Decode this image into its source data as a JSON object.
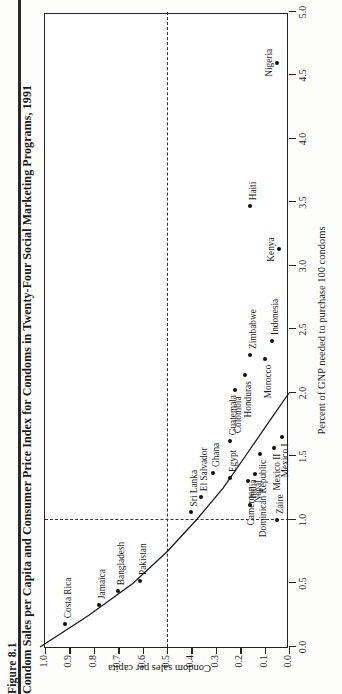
{
  "figure": {
    "number": "Figure 8.1",
    "title": "Condom Sales per Capita and Consumer Price Index for Condoms in Twenty-Four Social Marketing Programs, 1991"
  },
  "chart_data": {
    "type": "scatter",
    "title": "Condom Sales per Capita and Consumer Price Index for Condoms in Twenty-Four Social Marketing Programs, 1991",
    "xlabel": "Percent of GNP needed to purchase 100 condoms",
    "ylabel": "Condom sales per capita",
    "xlim": [
      0.0,
      5.0
    ],
    "ylim": [
      0.0,
      1.0
    ],
    "xticks": [
      "0.0",
      "0.5",
      "1.0",
      "1.5",
      "2.0",
      "2.5",
      "3.0",
      "3.5",
      "4.0",
      "4.5",
      "5.0"
    ],
    "yticks": [
      "0.0",
      "0.1",
      "0.2",
      "0.3",
      "0.4",
      "0.5",
      "0.6",
      "0.7",
      "0.8",
      "0.9",
      "1.0"
    ],
    "grid": false,
    "legend": "none",
    "reference_lines": [
      {
        "axis": "y",
        "value": 0.5,
        "style": "dashed"
      },
      {
        "axis": "x",
        "value": 1.0,
        "style": "dashed"
      }
    ],
    "points": [
      {
        "label": "Costa Rica",
        "x": 0.18,
        "y": 0.92,
        "lab_dx": 6,
        "lab_dy": -1,
        "anchor": "left"
      },
      {
        "label": "Jamaica",
        "x": 0.33,
        "y": 0.78,
        "lab_dx": 6,
        "lab_dy": -1,
        "anchor": "left"
      },
      {
        "label": "Bangladesh",
        "x": 0.44,
        "y": 0.7,
        "lab_dx": 6,
        "lab_dy": -1,
        "anchor": "left"
      },
      {
        "label": "Pakistan",
        "x": 0.52,
        "y": 0.61,
        "lab_dx": 6,
        "lab_dy": -1,
        "anchor": "left"
      },
      {
        "label": "Zaire",
        "x": 1.0,
        "y": 0.05,
        "lab_dx": 6,
        "lab_dy": -1,
        "anchor": "left"
      },
      {
        "label": "Sri Lanka",
        "x": 1.06,
        "y": 0.4,
        "lab_dx": 6,
        "lab_dy": -1,
        "anchor": "left"
      },
      {
        "label": "India",
        "x": 1.12,
        "y": 0.16,
        "lab_dx": 6,
        "lab_dy": -1,
        "anchor": "left"
      },
      {
        "label": "El Salvador",
        "x": 1.18,
        "y": 0.36,
        "lab_dx": 6,
        "lab_dy": -1,
        "anchor": "left"
      },
      {
        "label": "Cameroon",
        "x": 1.31,
        "y": 0.17,
        "lab_dx": -6,
        "lab_dy": -1,
        "anchor": "right"
      },
      {
        "label": "Nepal",
        "x": 1.36,
        "y": 0.14,
        "lab_dx": -6,
        "lab_dy": -1,
        "anchor": "right"
      },
      {
        "label": "Egypt",
        "x": 1.33,
        "y": 0.24,
        "lab_dx": 6,
        "lab_dy": -1,
        "anchor": "left"
      },
      {
        "label": "Ghana",
        "x": 1.37,
        "y": 0.31,
        "lab_dx": 6,
        "lab_dy": -1,
        "anchor": "left"
      },
      {
        "label": "Dominican Republic",
        "x": 1.52,
        "y": 0.12,
        "lab_dx": -6,
        "lab_dy": -1,
        "anchor": "right"
      },
      {
        "label": "Guatemala",
        "x": 1.62,
        "y": 0.24,
        "lab_dx": 6,
        "lab_dy": -1,
        "anchor": "left"
      },
      {
        "label": "Mexico II",
        "x": 1.57,
        "y": 0.06,
        "lab_dx": -6,
        "lab_dy": -1,
        "anchor": "right"
      },
      {
        "label": "Mexico I",
        "x": 1.65,
        "y": 0.03,
        "lab_dx": -6,
        "lab_dy": -1,
        "anchor": "right"
      },
      {
        "label": "Colombia",
        "x": 2.02,
        "y": 0.22,
        "lab_dx": -6,
        "lab_dy": -1,
        "anchor": "right"
      },
      {
        "label": "Honduras",
        "x": 2.14,
        "y": 0.18,
        "lab_dx": -6,
        "lab_dy": -1,
        "anchor": "right"
      },
      {
        "label": "Zimbabwe",
        "x": 2.3,
        "y": 0.16,
        "lab_dx": 6,
        "lab_dy": -1,
        "anchor": "left"
      },
      {
        "label": "Morocco",
        "x": 2.27,
        "y": 0.1,
        "lab_dx": -6,
        "lab_dy": -1,
        "anchor": "right"
      },
      {
        "label": "Indonesia",
        "x": 2.41,
        "y": 0.07,
        "lab_dx": 6,
        "lab_dy": -1,
        "anchor": "left"
      },
      {
        "label": "Kenya",
        "x": 3.13,
        "y": 0.04,
        "lab_dx": 0,
        "lab_dy": -12,
        "anchor": "center"
      },
      {
        "label": "Haiti",
        "x": 3.47,
        "y": 0.16,
        "lab_dx": 6,
        "lab_dy": -1,
        "anchor": "left"
      },
      {
        "label": "Nigeria",
        "x": 4.6,
        "y": 0.05,
        "lab_dx": 0,
        "lab_dy": -12,
        "anchor": "center"
      }
    ],
    "fit_curve": {
      "description": "Downward-sloping convex fitted curve from high sales at low price to near-zero sales at about 2.0 percent of GNP",
      "x": [
        0.0,
        0.25,
        0.5,
        0.75,
        1.0,
        1.25,
        1.5,
        1.75,
        2.0
      ],
      "y": [
        1.02,
        0.82,
        0.64,
        0.5,
        0.38,
        0.27,
        0.18,
        0.09,
        0.0
      ]
    }
  }
}
